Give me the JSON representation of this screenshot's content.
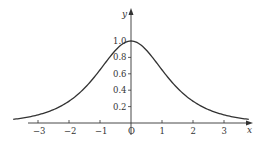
{
  "chart_data": {
    "type": "line",
    "title": "",
    "function": "y = sech(x)",
    "xlabel": "x",
    "ylabel": "y",
    "xlim": [
      -3.8,
      3.8
    ],
    "ylim": [
      0,
      1.1
    ],
    "grid": false,
    "legend": null,
    "x_ticks": [
      -3,
      -2,
      -1,
      0,
      1,
      2,
      3
    ],
    "x_tick_labels": [
      "−3",
      "−2",
      "−1",
      "O",
      "1",
      "2",
      "3"
    ],
    "y_ticks": [
      0.2,
      0.4,
      0.6,
      0.8,
      1.0
    ],
    "y_tick_labels": [
      "0.2",
      "0.4",
      "0.6",
      "0.8",
      "1.0"
    ],
    "series": [
      {
        "name": "sech(x)",
        "x": [
          -3.5,
          -3,
          -2.5,
          -2,
          -1.5,
          -1,
          -0.5,
          0,
          0.5,
          1,
          1.5,
          2,
          2.5,
          3,
          3.5
        ],
        "values": [
          0.06,
          0.099,
          0.163,
          0.266,
          0.425,
          0.648,
          0.887,
          1.0,
          0.887,
          0.648,
          0.425,
          0.266,
          0.163,
          0.099,
          0.06
        ]
      }
    ],
    "color": "#333333"
  }
}
